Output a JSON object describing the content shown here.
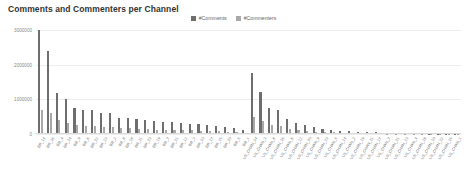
{
  "chart_data": {
    "type": "bar",
    "title": "Comments and Commenters per Channel",
    "xlabel": "",
    "ylabel": "",
    "ylim": [
      0,
      3000000
    ],
    "yticks": [
      0,
      1000000,
      2000000,
      3000000
    ],
    "ytick_labels": [
      "0",
      "1000000",
      "2000000",
      "3000000"
    ],
    "grid": true,
    "legend_position": "top-center",
    "colors": {
      "comments": "#6e6e6e",
      "commenters": "#a8a8a8",
      "gridline": "#ededed",
      "axis": "#d9d9d9",
      "title": "#333333",
      "tick_text": "#7a7a7a"
    },
    "categories": [
      "BR_14",
      "BR_16",
      "BR_4",
      "BR_24",
      "BR_9",
      "BR_6",
      "BR_22",
      "BR_13",
      "BR_2",
      "BR_8",
      "BR_18",
      "BR_11",
      "BR_23",
      "BR_19",
      "BR_7",
      "BR_21",
      "BR_12",
      "BR_3",
      "BR_10",
      "BR_17",
      "BR_15",
      "BR_20",
      "BR_5",
      "BR_1",
      "US_CHAN_24",
      "US_CHAN_3",
      "US_CHAN_8",
      "US_CHAN_16",
      "US_CHAN_6",
      "US_CHAN_12",
      "US_CHAN_20",
      "US_CHAN_9",
      "US_CHAN_23",
      "US_CHAN_5",
      "US_CHAN_14",
      "US_CHAN_2",
      "US_CHAN_19",
      "US_CHAN_11",
      "US_CHAN_17",
      "US_CHAN_7",
      "US_CHAN_21",
      "US_CHAN_13",
      "US_CHAN_4",
      "US_CHAN_18",
      "US_CHAN_10",
      "US_CHAN_22",
      "US_CHAN_15",
      "US_CHAN_1"
    ],
    "series": [
      {
        "name": "#Comments",
        "values": [
          3000000,
          2400000,
          1180000,
          1020000,
          760000,
          700000,
          690000,
          620000,
          600000,
          470000,
          450000,
          430000,
          400000,
          380000,
          360000,
          340000,
          320000,
          300000,
          280000,
          260000,
          240000,
          200000,
          160000,
          120000,
          1750000,
          1220000,
          760000,
          700000,
          420000,
          330000,
          260000,
          190000,
          150000,
          120000,
          95000,
          80000,
          68000,
          55000,
          45000,
          38000,
          30000,
          25000,
          20000,
          16000,
          13000,
          10000,
          8000,
          6000
        ]
      },
      {
        "name": "#Commenters",
        "values": [
          700000,
          620000,
          400000,
          320000,
          250000,
          240000,
          230000,
          210000,
          200000,
          170000,
          160000,
          150000,
          140000,
          130000,
          125000,
          120000,
          110000,
          105000,
          95000,
          90000,
          85000,
          70000,
          55000,
          42000,
          480000,
          380000,
          260000,
          230000,
          150000,
          120000,
          95000,
          70000,
          55000,
          45000,
          36000,
          30000,
          25000,
          21000,
          17000,
          14000,
          11000,
          9000,
          7500,
          6000,
          5000,
          4000,
          3200,
          2500
        ]
      }
    ]
  }
}
